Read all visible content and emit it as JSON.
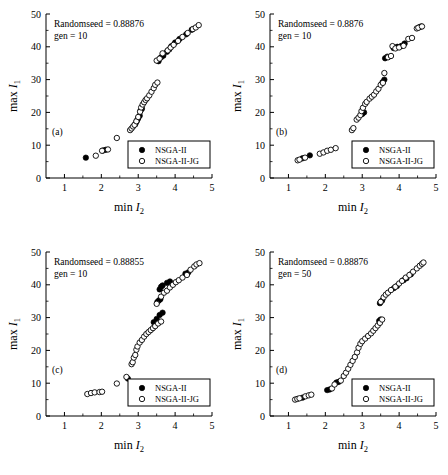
{
  "figure": {
    "background": "#ffffff",
    "marker_color": "#000000"
  },
  "axes": {
    "xlabel_prefix": "min ",
    "xlabel_symbol": "I",
    "xlabel_sub": "2",
    "ylabel_prefix": "max ",
    "ylabel_symbol": "I",
    "ylabel_sub": "1",
    "xticks": [
      "1",
      "2",
      "3",
      "4",
      "5"
    ],
    "yticks": [
      "0",
      "10",
      "20",
      "30",
      "40",
      "50"
    ],
    "xlim": [
      0.5,
      5.0
    ],
    "ylim": [
      0,
      50
    ]
  },
  "legend": {
    "entries": [
      {
        "label": "NSGA-II",
        "marker": "filled-circle"
      },
      {
        "label": "NSGA-II-JG",
        "marker": "open-circle"
      }
    ]
  },
  "chart_data": [
    {
      "type": "scatter",
      "panel": "(a)",
      "title": "",
      "annotation_seed": "Randomseed = 0.88876",
      "annotation_gen": "gen = 10",
      "xlabel": "min I2",
      "ylabel": "max I1",
      "xlim": [
        0.5,
        5.0
      ],
      "ylim": [
        0,
        50
      ],
      "xticks": [
        1,
        2,
        3,
        4,
        5
      ],
      "yticks": [
        0,
        10,
        20,
        30,
        40,
        50
      ],
      "grid": false,
      "legend_position": "lower-right",
      "series": [
        {
          "name": "NSGA-II",
          "marker": "filled-circle",
          "points": [
            [
              1.58,
              6.2
            ],
            [
              2.05,
              8.4
            ],
            [
              2.12,
              8.6
            ],
            [
              2.92,
              16.4
            ],
            [
              2.95,
              17.1
            ],
            [
              2.97,
              17.6
            ],
            [
              3.0,
              18.2
            ],
            [
              3.04,
              19.0
            ],
            [
              3.06,
              20.5
            ],
            [
              3.1,
              21.1
            ],
            [
              3.55,
              35.6
            ],
            [
              3.62,
              36.8
            ],
            [
              3.68,
              37.3
            ],
            [
              3.78,
              38.5
            ],
            [
              3.84,
              39.2
            ],
            [
              3.9,
              40.2
            ],
            [
              4.0,
              41.3
            ],
            [
              4.12,
              42.4
            ],
            [
              4.3,
              43.8
            ],
            [
              4.45,
              45.2
            ]
          ]
        },
        {
          "name": "NSGA-II-JG",
          "marker": "open-circle",
          "points": [
            [
              1.85,
              6.8
            ],
            [
              2.02,
              8.3
            ],
            [
              2.18,
              8.7
            ],
            [
              2.42,
              12.2
            ],
            [
              2.78,
              14.6
            ],
            [
              2.82,
              15.1
            ],
            [
              2.86,
              15.7
            ],
            [
              2.9,
              16.2
            ],
            [
              2.95,
              17.3
            ],
            [
              3.0,
              18.6
            ],
            [
              3.05,
              20.2
            ],
            [
              3.08,
              21.5
            ],
            [
              3.12,
              22.4
            ],
            [
              3.16,
              23.1
            ],
            [
              3.2,
              23.8
            ],
            [
              3.24,
              24.3
            ],
            [
              3.3,
              25.2
            ],
            [
              3.36,
              26.3
            ],
            [
              3.42,
              27.4
            ],
            [
              3.46,
              28.4
            ],
            [
              3.52,
              29.1
            ],
            [
              3.5,
              35.8
            ],
            [
              3.58,
              36.4
            ],
            [
              3.66,
              38.0
            ],
            [
              3.8,
              38.9
            ],
            [
              3.88,
              39.8
            ],
            [
              3.96,
              40.6
            ],
            [
              4.08,
              41.8
            ],
            [
              4.2,
              43.0
            ],
            [
              4.34,
              44.2
            ],
            [
              4.48,
              45.4
            ],
            [
              4.56,
              45.9
            ],
            [
              4.64,
              46.6
            ]
          ]
        }
      ]
    },
    {
      "type": "scatter",
      "panel": "(b)",
      "title": "",
      "annotation_seed": "Randomseed = 0.8876",
      "annotation_gen": "gen = 10",
      "xlabel": "min I2",
      "ylabel": "max I1",
      "xlim": [
        0.5,
        5.0
      ],
      "ylim": [
        0,
        50
      ],
      "xticks": [
        1,
        2,
        3,
        4,
        5
      ],
      "yticks": [
        0,
        10,
        20,
        30,
        40,
        50
      ],
      "grid": false,
      "legend_position": "lower-right",
      "series": [
        {
          "name": "NSGA-II",
          "marker": "filled-circle",
          "points": [
            [
              1.38,
              6.0
            ],
            [
              1.58,
              6.9
            ],
            [
              3.0,
              19.5
            ],
            [
              3.05,
              20.0
            ],
            [
              3.55,
              29.2
            ],
            [
              3.6,
              30.0
            ],
            [
              3.62,
              36.5
            ],
            [
              3.68,
              37.0
            ],
            [
              3.85,
              39.6
            ],
            [
              3.95,
              40.0
            ],
            [
              4.05,
              40.2
            ],
            [
              4.1,
              40.4
            ],
            [
              4.15,
              41.0
            ],
            [
              4.55,
              46.0
            ],
            [
              4.6,
              46.2
            ]
          ]
        },
        {
          "name": "NSGA-II-JG",
          "marker": "open-circle",
          "points": [
            [
              1.25,
              5.4
            ],
            [
              1.3,
              5.6
            ],
            [
              1.45,
              6.2
            ],
            [
              1.85,
              7.4
            ],
            [
              1.95,
              7.8
            ],
            [
              2.05,
              8.3
            ],
            [
              2.15,
              8.6
            ],
            [
              2.28,
              9.1
            ],
            [
              2.72,
              14.6
            ],
            [
              2.76,
              15.2
            ],
            [
              2.85,
              17.8
            ],
            [
              2.9,
              18.4
            ],
            [
              2.95,
              19.2
            ],
            [
              2.98,
              20.4
            ],
            [
              3.02,
              21.4
            ],
            [
              3.08,
              22.6
            ],
            [
              3.12,
              23.2
            ],
            [
              3.2,
              24.2
            ],
            [
              3.26,
              24.8
            ],
            [
              3.32,
              25.4
            ],
            [
              3.38,
              26.4
            ],
            [
              3.44,
              27.2
            ],
            [
              3.5,
              28.4
            ],
            [
              3.56,
              29.0
            ],
            [
              3.6,
              32.0
            ],
            [
              3.7,
              36.8
            ],
            [
              3.78,
              37.2
            ],
            [
              3.82,
              40.2
            ],
            [
              3.9,
              39.5
            ],
            [
              4.0,
              39.8
            ],
            [
              4.12,
              40.3
            ],
            [
              4.25,
              42.4
            ],
            [
              4.35,
              42.7
            ],
            [
              4.48,
              45.6
            ],
            [
              4.52,
              45.8
            ],
            [
              4.62,
              46.2
            ]
          ]
        }
      ]
    },
    {
      "type": "scatter",
      "panel": "(c)",
      "title": "",
      "annotation_seed": "Randomseed = 0.88855",
      "annotation_gen": "gen = 10",
      "xlabel": "min I2",
      "ylabel": "max I1",
      "xlim": [
        0.5,
        5.0
      ],
      "ylim": [
        0,
        50
      ],
      "xticks": [
        1,
        2,
        3,
        4,
        5
      ],
      "yticks": [
        0,
        10,
        20,
        30,
        40,
        50
      ],
      "grid": false,
      "legend_position": "lower-right",
      "series": [
        {
          "name": "NSGA-II",
          "marker": "filled-circle",
          "points": [
            [
              2.72,
              11.4
            ],
            [
              3.42,
              28.6
            ],
            [
              3.5,
              29.6
            ],
            [
              3.58,
              30.8
            ],
            [
              3.66,
              31.5
            ],
            [
              3.52,
              34.8
            ],
            [
              3.56,
              35.2
            ],
            [
              3.6,
              35.6
            ],
            [
              3.58,
              38.6
            ],
            [
              3.62,
              39.4
            ],
            [
              3.66,
              39.8
            ],
            [
              3.78,
              40.6
            ],
            [
              3.86,
              41.0
            ],
            [
              4.28,
              43.4
            ],
            [
              4.36,
              43.8
            ]
          ]
        },
        {
          "name": "NSGA-II-JG",
          "marker": "open-circle",
          "points": [
            [
              1.62,
              6.7
            ],
            [
              1.72,
              7.0
            ],
            [
              1.82,
              7.2
            ],
            [
              1.95,
              7.3
            ],
            [
              2.02,
              7.4
            ],
            [
              2.42,
              9.9
            ],
            [
              2.68,
              11.9
            ],
            [
              2.82,
              15.8
            ],
            [
              2.85,
              16.4
            ],
            [
              2.88,
              17.8
            ],
            [
              2.92,
              18.6
            ],
            [
              2.95,
              20.2
            ],
            [
              2.98,
              21.2
            ],
            [
              3.04,
              22.4
            ],
            [
              3.1,
              23.2
            ],
            [
              3.16,
              24.2
            ],
            [
              3.22,
              25.0
            ],
            [
              3.28,
              25.6
            ],
            [
              3.34,
              26.2
            ],
            [
              3.4,
              26.8
            ],
            [
              3.46,
              27.4
            ],
            [
              3.54,
              28.2
            ],
            [
              3.62,
              28.8
            ],
            [
              3.5,
              34.2
            ],
            [
              3.62,
              36.4
            ],
            [
              3.7,
              37.6
            ],
            [
              3.78,
              38.2
            ],
            [
              3.86,
              39.2
            ],
            [
              3.94,
              40.0
            ],
            [
              4.02,
              40.8
            ],
            [
              4.1,
              41.4
            ],
            [
              4.2,
              42.2
            ],
            [
              4.32,
              43.0
            ],
            [
              4.42,
              44.6
            ],
            [
              4.52,
              45.6
            ],
            [
              4.58,
              46.2
            ],
            [
              4.66,
              46.6
            ]
          ]
        }
      ]
    },
    {
      "type": "scatter",
      "panel": "(d)",
      "title": "",
      "annotation_seed": "Randomseed = 0.88876",
      "annotation_gen": "gen = 50",
      "xlabel": "min I2",
      "ylabel": "max I1",
      "xlim": [
        0.5,
        5.0
      ],
      "ylim": [
        0,
        50
      ],
      "xticks": [
        1,
        2,
        3,
        4,
        5
      ],
      "yticks": [
        0,
        10,
        20,
        30,
        40,
        50
      ],
      "grid": false,
      "legend_position": "lower-right",
      "series": [
        {
          "name": "NSGA-II",
          "marker": "filled-circle",
          "points": [
            [
              1.38,
              5.6
            ],
            [
              2.05,
              7.9
            ],
            [
              2.12,
              8.1
            ],
            [
              2.3,
              10.2
            ],
            [
              2.36,
              10.4
            ],
            [
              3.46,
              29.0
            ],
            [
              3.5,
              29.4
            ],
            [
              3.48,
              34.4
            ],
            [
              3.54,
              35.2
            ],
            [
              3.86,
              39.0
            ],
            [
              3.94,
              39.6
            ],
            [
              4.12,
              41.4
            ],
            [
              4.2,
              42.0
            ],
            [
              4.32,
              43.2
            ]
          ]
        },
        {
          "name": "NSGA-II-JG",
          "marker": "open-circle",
          "points": [
            [
              1.18,
              5.0
            ],
            [
              1.24,
              5.2
            ],
            [
              1.3,
              5.4
            ],
            [
              1.46,
              6.0
            ],
            [
              1.55,
              6.3
            ],
            [
              1.62,
              6.5
            ],
            [
              2.18,
              8.4
            ],
            [
              2.25,
              9.6
            ],
            [
              2.42,
              10.8
            ],
            [
              2.5,
              12.2
            ],
            [
              2.56,
              13.2
            ],
            [
              2.62,
              14.4
            ],
            [
              2.68,
              15.6
            ],
            [
              2.74,
              16.8
            ],
            [
              2.8,
              18.0
            ],
            [
              2.86,
              19.4
            ],
            [
              2.9,
              20.8
            ],
            [
              2.95,
              22.0
            ],
            [
              3.0,
              22.8
            ],
            [
              3.08,
              23.6
            ],
            [
              3.16,
              24.4
            ],
            [
              3.24,
              25.2
            ],
            [
              3.3,
              26.0
            ],
            [
              3.36,
              26.8
            ],
            [
              3.42,
              27.6
            ],
            [
              3.48,
              28.4
            ],
            [
              3.54,
              29.4
            ],
            [
              3.5,
              34.8
            ],
            [
              3.58,
              36.2
            ],
            [
              3.64,
              37.0
            ],
            [
              3.7,
              37.6
            ],
            [
              3.78,
              38.4
            ],
            [
              3.9,
              39.4
            ],
            [
              4.0,
              40.4
            ],
            [
              4.08,
              41.2
            ],
            [
              4.18,
              42.2
            ],
            [
              4.28,
              43.0
            ],
            [
              4.38,
              44.0
            ],
            [
              4.48,
              45.0
            ],
            [
              4.56,
              45.8
            ],
            [
              4.62,
              46.4
            ],
            [
              4.66,
              46.8
            ]
          ]
        }
      ]
    }
  ]
}
